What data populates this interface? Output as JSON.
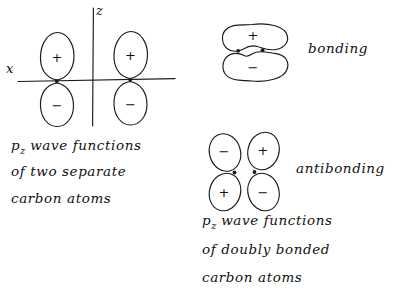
{
  "figure": {
    "background_color": "#ffffff",
    "ink_color": "#1a1a1a",
    "style": "hand-drawn pencil sketch"
  },
  "panel_separate": {
    "axes": {
      "x_label": "x",
      "z_label": "z"
    },
    "orbitals": [
      {
        "id": "left-upper",
        "sign": "+"
      },
      {
        "id": "left-lower",
        "sign": "−"
      },
      {
        "id": "right-upper",
        "sign": "+"
      },
      {
        "id": "right-lower",
        "sign": "−"
      }
    ],
    "nuclei_count": 2,
    "caption": {
      "line1_prefix": "p",
      "line1_subscript": "z",
      "line1_rest": "wave functions",
      "line2": "of two separate",
      "line3": "carbon atoms"
    }
  },
  "panel_bonding": {
    "label": "bonding",
    "lobes": [
      {
        "id": "bonding-upper",
        "sign": "+"
      },
      {
        "id": "bonding-lower",
        "sign": "−"
      }
    ],
    "nuclei_count": 2
  },
  "panel_antibonding": {
    "label": "antibonding",
    "lobes": [
      {
        "id": "anti-top-left",
        "sign": "−"
      },
      {
        "id": "anti-top-right",
        "sign": "+"
      },
      {
        "id": "anti-bottom-left",
        "sign": "+"
      },
      {
        "id": "anti-bottom-right",
        "sign": "−"
      }
    ],
    "nuclei_count": 2,
    "caption": {
      "line1_prefix": "p",
      "line1_subscript": "z",
      "line1_rest": "wave functions",
      "line2": "of doubly bonded",
      "line3": "carbon atoms"
    }
  }
}
